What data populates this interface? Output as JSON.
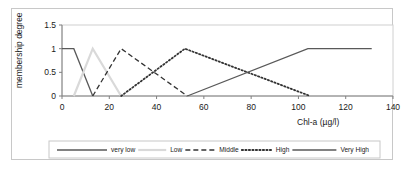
{
  "figure": {
    "frame_color": "#c8c8c8",
    "background": "#ffffff"
  },
  "axis": {
    "y_ticks": [
      "0",
      "0.5",
      "1",
      "1.5"
    ],
    "x_ticks": [
      "0",
      "20",
      "40",
      "60",
      "80",
      "100",
      "120",
      "140"
    ],
    "y_title": "membership degree",
    "x_title": "Chl-a (µg/l)"
  },
  "legend": {
    "items": [
      {
        "label": "very low",
        "style": "solid",
        "color": "#595959"
      },
      {
        "label": "Low",
        "style": "solid",
        "color": "#d9d9d9"
      },
      {
        "label": "Middle",
        "style": "dashed",
        "color": "#333333"
      },
      {
        "label": "High",
        "style": "dotted",
        "color": "#333333"
      },
      {
        "label": "Very High",
        "style": "solid",
        "color": "#595959"
      }
    ]
  },
  "chart_data": {
    "type": "line",
    "title": "",
    "xlabel": "Chl-a (µg/l)",
    "ylabel": "membership degree",
    "xlim": [
      0,
      140
    ],
    "ylim": [
      0,
      1.5
    ],
    "xticks": [
      0,
      20,
      40,
      60,
      80,
      100,
      120,
      140
    ],
    "yticks": [
      0,
      0.5,
      1,
      1.5
    ],
    "grid": false,
    "legend_position": "bottom",
    "series": [
      {
        "name": "very low",
        "style": "solid",
        "color": "#595959",
        "x": [
          0,
          5,
          13
        ],
        "y": [
          1,
          1,
          0
        ]
      },
      {
        "name": "Low",
        "style": "solid",
        "color": "#d9d9d9",
        "x": [
          5,
          13,
          25
        ],
        "y": [
          0,
          1,
          0
        ]
      },
      {
        "name": "Middle",
        "style": "dashed",
        "color": "#333333",
        "x": [
          13,
          25,
          53
        ],
        "y": [
          0,
          1,
          0
        ]
      },
      {
        "name": "High",
        "style": "dotted",
        "color": "#333333",
        "x": [
          25,
          52,
          105
        ],
        "y": [
          0,
          1,
          0
        ]
      },
      {
        "name": "Very High",
        "style": "solid",
        "color": "#595959",
        "x": [
          53,
          104,
          131
        ],
        "y": [
          0,
          1,
          1
        ]
      }
    ]
  }
}
